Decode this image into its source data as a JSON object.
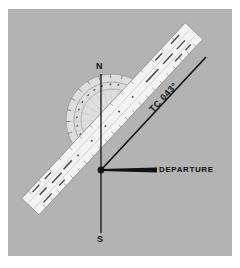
{
  "diagram": {
    "type": "navigation-plotter-true-course",
    "labels": {
      "north": "N",
      "south": "S",
      "departure": "DEPARTURE",
      "true_course": "TC 043°"
    },
    "course_degrees": 43,
    "colors": {
      "background": "#b3b3b3",
      "ruler": "#f2f2f2",
      "protractor": "#e4e4e4",
      "ink": "#111111"
    }
  }
}
